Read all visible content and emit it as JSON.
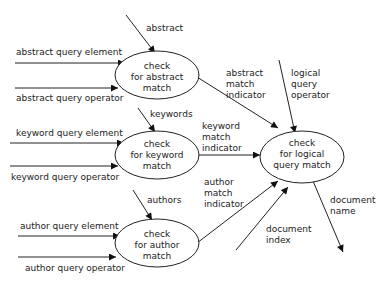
{
  "diagram": {
    "type": "data-flow diagram",
    "processes": {
      "abstract": {
        "line1": "check",
        "line2": "for abstract",
        "line3": "match"
      },
      "keyword": {
        "line1": "check",
        "line2": "for keyword",
        "line3": "match"
      },
      "author": {
        "line1": "check",
        "line2": "for author",
        "line3": "match"
      },
      "logical": {
        "line1": "check",
        "line2": "for logical",
        "line3": "query match"
      }
    },
    "flows": {
      "abstract": "abstract",
      "abstract_query_element": "abstract query element",
      "abstract_query_operator": "abstract query operator",
      "abstract_match_indicator": {
        "line1": "abstract",
        "line2": "match",
        "line3": "indicator"
      },
      "keywords": "keywords",
      "keyword_query_element": "keyword query element",
      "keyword_query_operator": "keyword query operator",
      "keyword_match_indicator": {
        "line1": "keyword",
        "line2": "match",
        "line3": "indicator"
      },
      "authors": "authors",
      "author_query_element": "author query element",
      "author_query_operator": "author query operator",
      "author_match_indicator": {
        "line1": "author",
        "line2": "match",
        "line3": "indicator"
      },
      "logical_query_operator": {
        "line1": "logical",
        "line2": "query",
        "line3": "operator"
      },
      "document_index": {
        "line1": "document",
        "line2": "index"
      },
      "document_name": {
        "line1": "document",
        "line2": "name"
      }
    }
  }
}
